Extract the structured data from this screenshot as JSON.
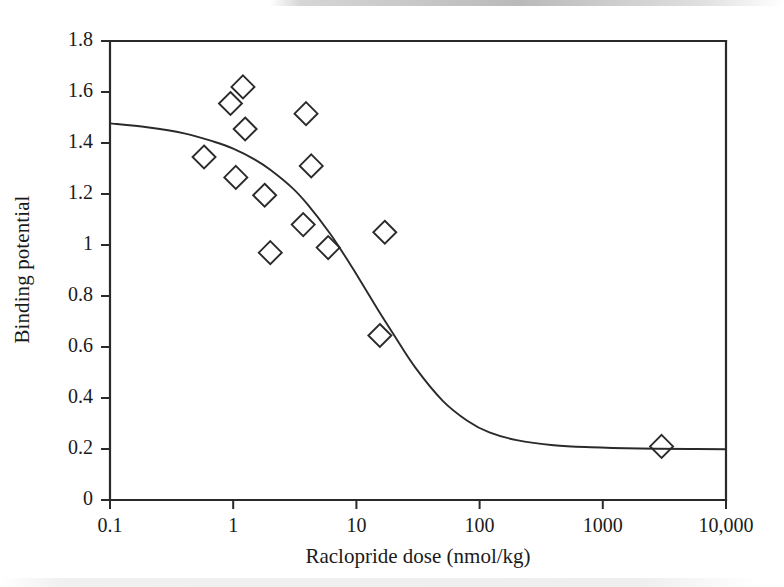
{
  "chart_data": {
    "type": "scatter",
    "title": "",
    "xlabel": "Raclopride dose (nmol/kg)",
    "ylabel": "Binding potential",
    "xscale": "log",
    "yscale": "linear",
    "xlim": [
      0.1,
      10000
    ],
    "ylim": [
      0,
      1.8
    ],
    "xticks": [
      0.1,
      1,
      10,
      100,
      1000,
      10000
    ],
    "xtick_labels": [
      "0.1",
      "1",
      "10",
      "100",
      "1000",
      "10,000"
    ],
    "yticks": [
      0,
      0.2,
      0.4,
      0.6,
      0.8,
      1,
      1.2,
      1.4,
      1.6,
      1.8
    ],
    "ytick_labels": [
      "0",
      "0.2",
      "0.4",
      "0.6",
      "0.8",
      "1",
      "1.2",
      "1.4",
      "1.6",
      "1.8"
    ],
    "grid": false,
    "legend": null,
    "marker": "open-diamond",
    "marker_color": "#2a2a2a",
    "line_color": "#2a2a2a",
    "series": [
      {
        "name": "Observed binding potential",
        "type": "scatter",
        "marker": "open-diamond",
        "points": [
          {
            "x": 0.58,
            "y": 1.345
          },
          {
            "x": 0.95,
            "y": 1.555
          },
          {
            "x": 1.2,
            "y": 1.62
          },
          {
            "x": 1.05,
            "y": 1.265
          },
          {
            "x": 1.25,
            "y": 1.455
          },
          {
            "x": 1.8,
            "y": 1.195
          },
          {
            "x": 2.0,
            "y": 0.97
          },
          {
            "x": 3.9,
            "y": 1.515
          },
          {
            "x": 4.3,
            "y": 1.31
          },
          {
            "x": 3.7,
            "y": 1.08
          },
          {
            "x": 5.9,
            "y": 0.99
          },
          {
            "x": 17.0,
            "y": 1.05
          },
          {
            "x": 15.5,
            "y": 0.645
          },
          {
            "x": 3000,
            "y": 0.21
          }
        ]
      },
      {
        "name": "Fitted sigmoid dose-response curve",
        "type": "line",
        "model": "four-parameter logistic",
        "top_asymptote": 1.48,
        "bottom_asymptote": 0.2,
        "ed50": 12.5,
        "hill_slope": 0.95,
        "curve": [
          {
            "x": 0.1,
            "y": 1.477
          },
          {
            "x": 0.2,
            "y": 1.462
          },
          {
            "x": 0.4,
            "y": 1.438
          },
          {
            "x": 0.7,
            "y": 1.405
          },
          {
            "x": 1.0,
            "y": 1.378
          },
          {
            "x": 1.5,
            "y": 1.335
          },
          {
            "x": 2.0,
            "y": 1.295
          },
          {
            "x": 3.0,
            "y": 1.225
          },
          {
            "x": 4.0,
            "y": 1.16
          },
          {
            "x": 6.0,
            "y": 1.05
          },
          {
            "x": 8.0,
            "y": 0.96
          },
          {
            "x": 10.0,
            "y": 0.885
          },
          {
            "x": 15.0,
            "y": 0.745
          },
          {
            "x": 20.0,
            "y": 0.65
          },
          {
            "x": 30.0,
            "y": 0.52
          },
          {
            "x": 50.0,
            "y": 0.39
          },
          {
            "x": 80.0,
            "y": 0.31
          },
          {
            "x": 120.0,
            "y": 0.265
          },
          {
            "x": 200.0,
            "y": 0.235
          },
          {
            "x": 400.0,
            "y": 0.215
          },
          {
            "x": 800.0,
            "y": 0.207
          },
          {
            "x": 2000,
            "y": 0.202
          },
          {
            "x": 5000,
            "y": 0.2
          },
          {
            "x": 10000,
            "y": 0.199
          }
        ]
      }
    ]
  },
  "axes": {
    "y_title": "Binding potential",
    "x_title": "Raclopride dose (nmol/kg)"
  },
  "colors": {
    "ink": "#2a2a2a",
    "background": "#ffffff"
  }
}
